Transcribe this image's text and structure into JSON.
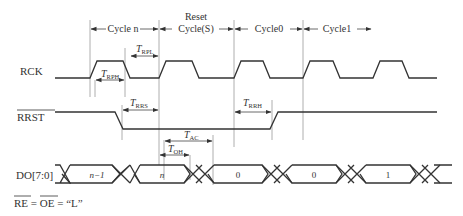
{
  "diagram": {
    "type": "timing-diagram",
    "signals": [
      {
        "name": "RCK",
        "overline": false
      },
      {
        "name": "RRST",
        "overline": true
      },
      {
        "name": "DO[7:0]",
        "overline": false
      }
    ],
    "cycles": [
      {
        "label": "Cycle n"
      },
      {
        "label_line1": "Reset",
        "label_line2": "Cycle(S)"
      },
      {
        "label": "Cycle0"
      },
      {
        "label": "Cycle1"
      }
    ],
    "timings": {
      "rph": {
        "sym": "T",
        "sub": "RPH"
      },
      "rpl": {
        "sym": "T",
        "sub": "RPL"
      },
      "rrs": {
        "sym": "T",
        "sub": "RRS"
      },
      "rrh": {
        "sym": "T",
        "sub": "RRH"
      },
      "ac": {
        "sym": "T",
        "sub": "AC"
      },
      "oh": {
        "sym": "T",
        "sub": "OH"
      }
    },
    "data_values": [
      "n−1",
      "n",
      "0",
      "0",
      "1"
    ],
    "footnote": {
      "re": "RE",
      "eq1": " = ",
      "oe": "OE",
      "eq2": " = “L”"
    }
  }
}
